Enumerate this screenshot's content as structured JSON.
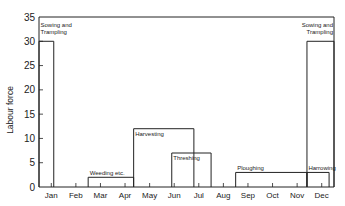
{
  "chart_data": {
    "type": "bar",
    "title": "",
    "xlabel": "",
    "ylabel": "Labour force",
    "ylim": [
      0,
      35
    ],
    "yticks": [
      0,
      5,
      10,
      15,
      20,
      25,
      30,
      35
    ],
    "grid": false,
    "categories": [
      "Jan",
      "Feb",
      "Mar",
      "Apr",
      "May",
      "Jun",
      "Jul",
      "Aug",
      "Sep",
      "Oct",
      "Nov",
      "Dec"
    ],
    "activities": [
      {
        "name": "Sowing and Trampling",
        "start_month": 0.0,
        "end_month": 0.6,
        "labour": 30,
        "label_lines": [
          "Sowing and",
          "Trampling"
        ],
        "label_align": "left"
      },
      {
        "name": "Weeding etc.",
        "start_month": 2.0,
        "end_month": 3.85,
        "labour": 2,
        "label_lines": [
          "Weeding etc."
        ],
        "label_align": "left"
      },
      {
        "name": "Harvesting",
        "start_month": 3.85,
        "end_month": 6.3,
        "labour": 12,
        "label_lines": [
          "Harvesting"
        ],
        "label_align": "left"
      },
      {
        "name": "Threshing",
        "start_month": 5.4,
        "end_month": 7.0,
        "labour": 7,
        "label_lines": [
          "Threshing"
        ],
        "label_align": "left"
      },
      {
        "name": "Ploughing",
        "start_month": 8.0,
        "end_month": 10.9,
        "labour": 3,
        "label_lines": [
          "Ploughing"
        ],
        "label_align": "left"
      },
      {
        "name": "Harrowing",
        "start_month": 10.9,
        "end_month": 11.8,
        "labour": 3,
        "label_lines": [
          "Harrowing"
        ],
        "label_align": "left"
      },
      {
        "name": "Sowing and Trampling",
        "start_month": 10.9,
        "end_month": 12.0,
        "labour": 30,
        "label_lines": [
          "Sowing and",
          "Trampling"
        ],
        "label_align": "right"
      }
    ],
    "legend": null
  }
}
